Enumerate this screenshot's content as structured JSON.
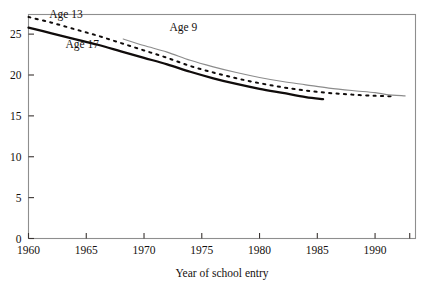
{
  "chart_data": {
    "type": "line",
    "title": "",
    "xlabel": "Year of school entry",
    "ylabel": "",
    "xlim": [
      1960,
      1993.5
    ],
    "ylim": [
      0,
      27.4
    ],
    "xticks": [
      1960,
      1965,
      1970,
      1975,
      1980,
      1985,
      1990
    ],
    "xtick_labels": [
      "1960",
      "1965",
      "1970",
      "1975",
      "1980",
      "1985",
      "1990"
    ],
    "yticks": [
      0,
      5,
      10,
      15,
      20,
      25
    ],
    "ytick_labels": [
      "0",
      "5",
      "10",
      "15",
      "20",
      "25"
    ],
    "grid": false,
    "legend_position": "inline-annotations",
    "frame": "box",
    "series": [
      {
        "name": "Age 17",
        "label": "Age 17",
        "style": "solid-thick",
        "color": "#100c0b",
        "label_x": 1963.2,
        "label_y": 23.3,
        "x": [
          1960,
          1962,
          1964,
          1966,
          1968,
          1970,
          1972,
          1974,
          1976,
          1978,
          1980,
          1982,
          1984,
          1985.5
        ],
        "y": [
          25.8,
          25.1,
          24.4,
          23.7,
          22.9,
          22.1,
          21.3,
          20.4,
          19.6,
          18.9,
          18.3,
          17.8,
          17.3,
          17.05
        ]
      },
      {
        "name": "Age 13",
        "label": "Age 13",
        "style": "dotted",
        "color": "#100c0b",
        "label_x": 1961.8,
        "label_y": 27.0,
        "x": [
          1960,
          1962,
          1964,
          1966,
          1968,
          1970,
          1972,
          1974,
          1976,
          1978,
          1980,
          1982,
          1984,
          1986,
          1988,
          1990,
          1991.5
        ],
        "y": [
          27.1,
          26.4,
          25.6,
          24.8,
          23.9,
          23.0,
          22.1,
          21.1,
          20.3,
          19.6,
          19.0,
          18.5,
          18.1,
          17.8,
          17.6,
          17.45,
          17.4
        ]
      },
      {
        "name": "Age 9",
        "label": "Age 9",
        "style": "solid-thin",
        "color": "#8c8c8c",
        "label_x": 1972.2,
        "label_y": 25.4,
        "x": [
          1968.2,
          1970,
          1972,
          1974,
          1976,
          1978,
          1980,
          1982,
          1984,
          1986,
          1988,
          1990,
          1991,
          1992.6
        ],
        "y": [
          24.4,
          23.6,
          22.8,
          21.8,
          21.0,
          20.3,
          19.7,
          19.2,
          18.8,
          18.4,
          18.1,
          17.85,
          17.6,
          17.45
        ]
      }
    ]
  },
  "axis": {
    "x_title": "Year of school entry"
  }
}
